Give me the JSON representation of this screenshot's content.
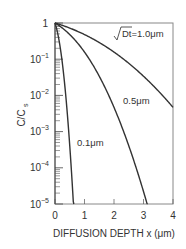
{
  "chart_data": {
    "type": "line",
    "title": "",
    "xlabel": "DIFFUSION DEPTH x (μm)",
    "ylabel": "C/C_s",
    "ylabel_main": "C/C",
    "ylabel_sub": "s",
    "xlim": [
      0,
      4
    ],
    "ylim": [
      1e-05,
      1
    ],
    "yscale": "log",
    "grid": false,
    "x_ticks": [
      "0",
      "1",
      "2",
      "3",
      "4"
    ],
    "y_ticks": [
      {
        "base": "1",
        "exp": ""
      },
      {
        "base": "10",
        "exp": "−1"
      },
      {
        "base": "10",
        "exp": "−2"
      },
      {
        "base": "10",
        "exp": "−3"
      },
      {
        "base": "10",
        "exp": "−4"
      },
      {
        "base": "10",
        "exp": "−5"
      }
    ],
    "series": [
      {
        "name": "√Dt=1.0μm",
        "sqrt_Dt_um": 1.0,
        "x": [
          0,
          0.5,
          1,
          1.5,
          2,
          2.5,
          3,
          3.5,
          4
        ],
        "values": [
          1,
          0.72,
          0.48,
          0.29,
          0.157,
          0.076,
          0.034,
          0.0133,
          0.0047
        ]
      },
      {
        "name": "0.5μm",
        "sqrt_Dt_um": 0.5,
        "x": [
          0,
          0.5,
          1,
          1.5,
          2,
          2.5,
          3,
          3.1
        ],
        "values": [
          1,
          0.48,
          0.157,
          0.034,
          0.0047,
          0.00041,
          2.2e-05,
          1e-05
        ]
      },
      {
        "name": "0.1μm",
        "sqrt_Dt_um": 0.1,
        "x": [
          0,
          0.1,
          0.2,
          0.3,
          0.4,
          0.5,
          0.6,
          0.62
        ],
        "values": [
          1,
          0.48,
          0.157,
          0.034,
          0.0047,
          0.00041,
          2.2e-05,
          1e-05
        ]
      }
    ],
    "annotations": [
      {
        "text": "√Dt=1.0μm",
        "near_series": "1.0"
      },
      {
        "text": "0.5μm",
        "near_series": "0.5"
      },
      {
        "text": "0.1μm",
        "near_series": "0.1"
      }
    ]
  },
  "labels": {
    "curve_1": "Dt=1.0μm",
    "curve_05": "0.5μm",
    "curve_01": "0.1μm"
  }
}
